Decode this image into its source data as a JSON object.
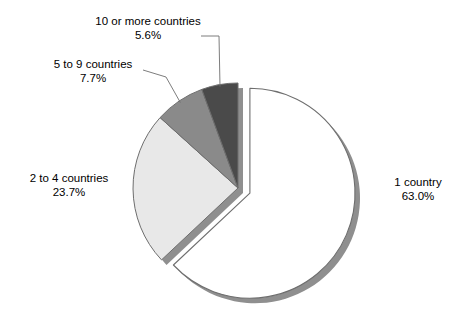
{
  "chart_data": {
    "type": "pie",
    "title": "",
    "subtitle": "",
    "xlabel": "",
    "ylabel": "",
    "legend_position": "none",
    "grid": false,
    "units": "percent",
    "exploded_slice": "1 country",
    "start_angle_deg": 0,
    "direction": "clockwise",
    "categories": [
      "1 country",
      "2 to 4 countries",
      "5 to 9 countries",
      "10 or more countries"
    ],
    "values": [
      63.0,
      23.7,
      7.7,
      5.6
    ],
    "slices": [
      {
        "label": "1 country",
        "percent_text": "63.0%",
        "value": 63.0,
        "color": "#ffffff",
        "stroke": "#6e6e6e",
        "exploded": true,
        "has_leader_line": false
      },
      {
        "label": "2 to 4 countries",
        "percent_text": "23.7%",
        "value": 23.7,
        "color": "#e8e8e8",
        "stroke": "#6e6e6e",
        "exploded": false,
        "has_leader_line": false
      },
      {
        "label": "5 to 9 countries",
        "percent_text": "7.7%",
        "value": 7.7,
        "color": "#8a8a8a",
        "stroke": "#6e6e6e",
        "exploded": false,
        "has_leader_line": true
      },
      {
        "label": "10 or more countries",
        "percent_text": "5.6%",
        "value": 5.6,
        "color": "#4a4a4a",
        "stroke": "#6e6e6e",
        "exploded": false,
        "has_leader_line": true
      }
    ]
  },
  "colors": {
    "background": "#ffffff",
    "text": "#000000",
    "outline": "#6e6e6e",
    "shadow": "#8f8f8f",
    "leader_line": "#6e6e6e",
    "slice_1_country": "#ffffff",
    "slice_2_to_4": "#e8e8e8",
    "slice_5_to_9": "#8a8a8a",
    "slice_10_or_more": "#4a4a4a"
  }
}
